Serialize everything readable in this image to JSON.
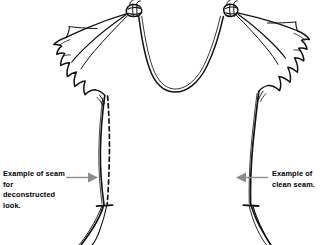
{
  "document": {
    "type": "fashion-technical-sketch",
    "subject": "Sleeveless top with flutter sleeves, knotted shoulders and deep U neckline",
    "background_color": "#ffffff",
    "ink_color": "#111111",
    "annotation_color": "#8a8a8a"
  },
  "annotations": {
    "left": {
      "name": "deconstructed-seam-callout",
      "text": "Example of seam\nfor deconstructed\nlook.",
      "arrow_direction": "right",
      "arrow_color": "#8d8d8d"
    },
    "right": {
      "name": "clean-seam-callout",
      "text": "Example of\nclean seam.",
      "arrow_direction": "left",
      "arrow_color": "#8d8d8d"
    }
  },
  "garment": {
    "neckline": "deep U scoop",
    "shoulders": "knotted gathered straps",
    "sleeves": "draped scalloped flutter sleeves",
    "left_seam_style": "dashed",
    "right_seam_style": "solid"
  }
}
